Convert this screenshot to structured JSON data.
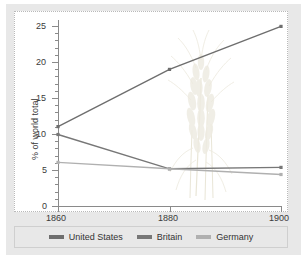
{
  "chart_data": {
    "type": "line",
    "title": "",
    "subtitle": "",
    "xlabel": "",
    "ylabel": "% of world total",
    "x": [
      1860,
      1880,
      1900
    ],
    "xticklabels": [
      "1860",
      "1880",
      "1900"
    ],
    "yticklabels": [
      "0",
      "5",
      "10",
      "15",
      "20",
      "25"
    ],
    "yticks": [
      0,
      5,
      10,
      15,
      20,
      25
    ],
    "xlim": [
      1860,
      1900
    ],
    "ylim": [
      0,
      26
    ],
    "grid": false,
    "legend_position": "bottom",
    "series": [
      {
        "name": "United States",
        "values": [
          11.1,
          19.1,
          25.1
        ],
        "color": "#6e6e6e"
      },
      {
        "name": "Britain",
        "values": [
          10.0,
          5.2,
          5.4
        ],
        "color": "#777777"
      },
      {
        "name": "Germany",
        "values": [
          6.1,
          5.2,
          4.4
        ],
        "color": "#b0b0b0"
      }
    ],
    "annotations": [
      {
        "name": "wheat-watermark",
        "description": "faint wheat stalk illustration behind plot"
      }
    ]
  },
  "legend": {
    "items": [
      {
        "label": "United States",
        "color": "#6e6e6e"
      },
      {
        "label": "Britain",
        "color": "#777777"
      },
      {
        "label": "Germany",
        "color": "#b0b0b0"
      }
    ]
  },
  "axes": {
    "y_title": "% of world total",
    "y_labels": [
      "25",
      "20",
      "15",
      "10",
      "5",
      "0"
    ],
    "x_labels": [
      "1860",
      "1880",
      "1900"
    ]
  },
  "colors": {
    "background": "#e8e8e8",
    "panel": "#ffffff",
    "axis": "#8a8a8a",
    "text": "#3a3a3a",
    "watermark": "#c8bf93"
  }
}
